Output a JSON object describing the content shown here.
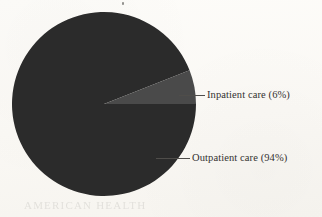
{
  "figure": {
    "background_color": "#fbfaf7",
    "width": 322,
    "height": 217
  },
  "chart_data": {
    "type": "pie",
    "title": "",
    "subtitle": "",
    "xlabel": "",
    "ylabel": "",
    "legend_position": "none",
    "grid": false,
    "labels": [
      "Outpatient care",
      "Inpatient care"
    ],
    "values": [
      94,
      6
    ],
    "unit": "%",
    "colors": [
      "#2b2b2b",
      "#4a4a4a"
    ],
    "annotations": [
      "Inpatient care (6%)",
      "Outpatient care (94%)"
    ],
    "slices": [
      {
        "name": "outpatient",
        "label": "Outpatient care",
        "value": 94,
        "value_text": "94%",
        "callout_text": "Outpatient care (94%)",
        "color": "#2b2b2b"
      },
      {
        "name": "inpatient",
        "label": "Inpatient care",
        "value": 6,
        "value_text": "6%",
        "callout_text": "Inpatient care (6%)",
        "color": "#4a4a4a"
      }
    ]
  },
  "callouts": {
    "inpatient": {
      "text": "Inpatient care (6%)",
      "leader_color": "#4f4d4a"
    },
    "outpatient": {
      "text": "Outpatient care (94%)",
      "leader_color": "#4f4d4a"
    }
  },
  "artifacts": {
    "bleed_text": "AMERICAN HEALTH"
  }
}
